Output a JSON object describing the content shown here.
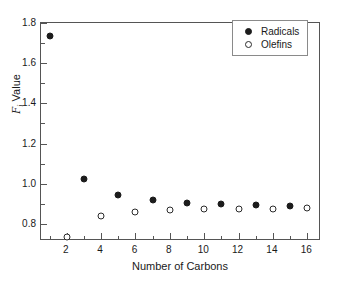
{
  "chart_data": {
    "type": "scatter",
    "title": "",
    "xlabel": "Number of Carbons",
    "ylabel_symbol": "F",
    "ylabel_subscript": "i",
    "ylabel_text": "Value",
    "ylabel": "Fi Value",
    "xlim": [
      0.5,
      16.8
    ],
    "ylim": [
      0.715,
      1.8
    ],
    "grid": false,
    "legend_position": "top-right",
    "xticks": [
      2,
      4,
      6,
      8,
      10,
      12,
      14,
      16
    ],
    "xtick_labels": [
      "2",
      "4",
      "6",
      "8",
      "10",
      "12",
      "14",
      "16"
    ],
    "xminor_ticks": [
      1,
      3,
      5,
      7,
      9,
      11,
      13,
      15
    ],
    "yticks": [
      0.8,
      1.0,
      1.2,
      1.4,
      1.6,
      1.8
    ],
    "ytick_labels": [
      "0.8",
      "1.0",
      "1.2",
      "1.4",
      "1.6",
      "1.8"
    ],
    "yminor_ticks": [
      0.9,
      1.1,
      1.3,
      1.5,
      1.7
    ],
    "series": [
      {
        "name": "Radicals",
        "marker": "filled-circle",
        "color": "#1c1c1c",
        "x": [
          1,
          3,
          5,
          7,
          9,
          11,
          13,
          15
        ],
        "values": [
          1.733,
          1.025,
          0.944,
          0.917,
          0.903,
          0.897,
          0.892,
          0.889
        ]
      },
      {
        "name": "Olefins",
        "marker": "open-circle",
        "color": "#2b2b2b",
        "x": [
          2,
          4,
          6,
          8,
          10,
          12,
          14,
          16
        ],
        "values": [
          0.735,
          0.837,
          0.86,
          0.868,
          0.872,
          0.875,
          0.876,
          0.877
        ]
      }
    ]
  },
  "legend": {
    "entries": [
      {
        "label": "Radicals",
        "marker": "filled-circle"
      },
      {
        "label": "Olefins",
        "marker": "open-circle"
      }
    ]
  },
  "axes": {
    "frame_color": "#555555"
  }
}
